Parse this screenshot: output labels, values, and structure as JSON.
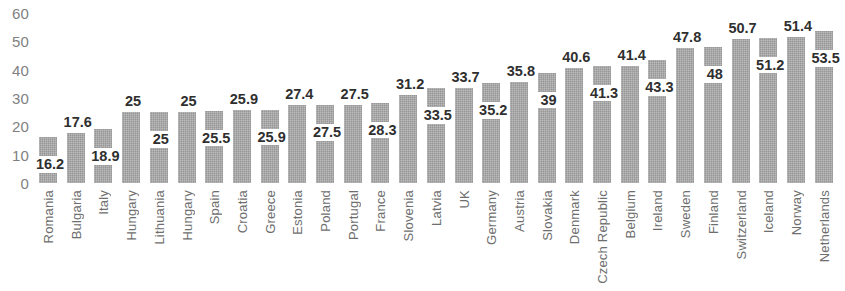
{
  "chart_data": {
    "type": "bar",
    "title": "",
    "subtitle": "",
    "xlabel": "",
    "ylabel": "",
    "ylim": [
      0,
      60
    ],
    "yticks": [
      0,
      10,
      20,
      30,
      40,
      50,
      60
    ],
    "ytick_labels": [
      "0",
      "10",
      "20",
      "30",
      "40",
      "50",
      "60"
    ],
    "grid": false,
    "legend": null,
    "legend_position": "none",
    "bar_color": "#a6a6a6",
    "categories": [
      "Romania",
      "Bulgaria",
      "Italy",
      "Hungary",
      "Lithuania",
      "Hungary",
      "Spain",
      "Croatia",
      "Greece",
      "Estonia",
      "Poland",
      "Portugal",
      "France",
      "Slovenia",
      "Latvia",
      "UK",
      "Germany",
      "Austria",
      "Slovakia",
      "Denmark",
      "Czech Republic",
      "Belgium",
      "Ireland",
      "Sweden",
      "Finland",
      "Switzerland",
      "Iceland",
      "Norway",
      "Netherlands"
    ],
    "values": [
      16.2,
      17.6,
      18.9,
      25,
      25,
      25,
      25.5,
      25.9,
      25.9,
      27.4,
      27.5,
      27.5,
      28.3,
      31.2,
      33.5,
      33.7,
      35.2,
      35.8,
      39,
      40.6,
      41.3,
      41.4,
      43.3,
      47.8,
      48,
      50.7,
      51.2,
      51.4,
      53.5
    ],
    "value_labels": [
      "16.2",
      "17.6",
      "18.9",
      "25",
      "25",
      "25",
      "25.5",
      "25.9",
      "25.9",
      "27.4",
      "27.5",
      "27.5",
      "28.3",
      "31.2",
      "33.5",
      "33.7",
      "35.2",
      "35.8",
      "39",
      "40.6",
      "41.3",
      "41.4",
      "43.3",
      "47.8",
      "48",
      "50.7",
      "51.2",
      "51.4",
      "53.5"
    ],
    "label_placement": [
      "inside",
      "above",
      "inside",
      "above",
      "inside",
      "above",
      "inside",
      "above",
      "inside",
      "above",
      "inside",
      "above",
      "inside",
      "above",
      "inside",
      "above",
      "inside",
      "above",
      "inside",
      "above",
      "inside",
      "above",
      "inside",
      "above",
      "inside",
      "above",
      "inside",
      "above",
      "inside"
    ]
  }
}
